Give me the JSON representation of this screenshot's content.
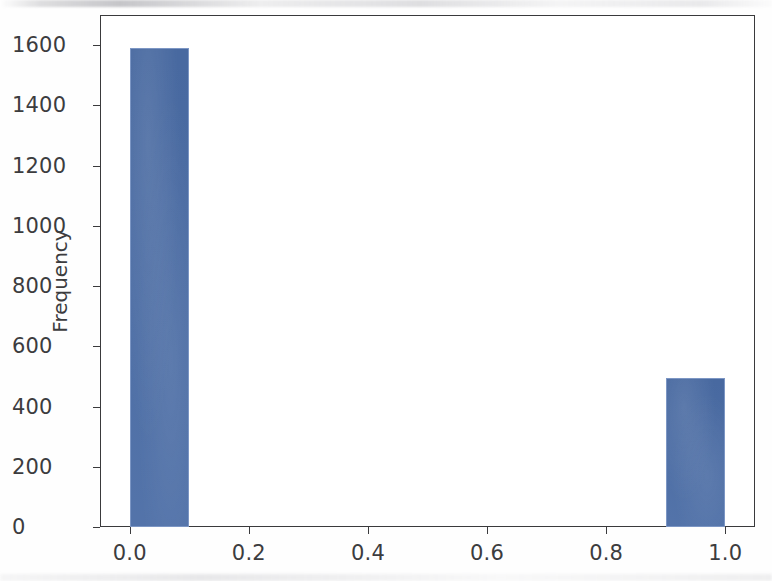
{
  "chart_data": {
    "type": "bar",
    "title": "",
    "xlabel": "",
    "ylabel": "Frequency",
    "categories": [
      "0.0",
      "1.0"
    ],
    "bin_edges": [
      0.0,
      0.1,
      0.9,
      1.0
    ],
    "bins": [
      {
        "left": 0.0,
        "right": 0.1,
        "value": 1590
      },
      {
        "left": 0.9,
        "right": 1.0,
        "value": 495
      }
    ],
    "values": [
      1590,
      495
    ],
    "xlim": [
      -0.05,
      1.05
    ],
    "ylim": [
      0,
      1700
    ],
    "xticks": [
      0.0,
      0.2,
      0.4,
      0.6,
      0.8,
      1.0
    ],
    "xticklabels": [
      "0.0",
      "0.2",
      "0.4",
      "0.6",
      "0.8",
      "1.0"
    ],
    "yticks": [
      0,
      200,
      400,
      600,
      800,
      1000,
      1200,
      1400,
      1600
    ],
    "yticklabels": [
      "0",
      "200",
      "400",
      "600",
      "800",
      "1000",
      "1200",
      "1400",
      "1600"
    ],
    "grid": false,
    "legend": null,
    "bar_color": "#4a6ca5",
    "bar_edge_color": "#7c96c4",
    "axis_color": "#3a3a3c",
    "background_color": "#ffffff"
  }
}
